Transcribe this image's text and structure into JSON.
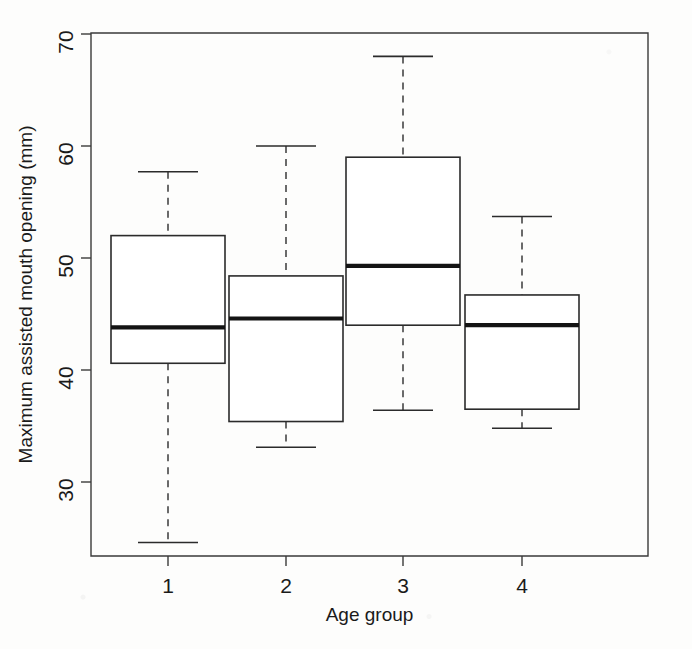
{
  "chart_data": {
    "type": "box",
    "title": "",
    "xlabel": "Age group",
    "ylabel": "Maximum assisted mouth opening (mm)",
    "categories": [
      "1",
      "2",
      "3",
      "4"
    ],
    "xtick_labels": [
      "1",
      "2",
      "3",
      "4"
    ],
    "ytick_labels": [
      "30",
      "40",
      "50",
      "60",
      "70"
    ],
    "yticks": [
      30,
      40,
      50,
      60,
      70
    ],
    "ylim": [
      23.5,
      70
    ],
    "xlim": [
      0.5,
      4.5
    ],
    "grid": false,
    "legend": false,
    "boxes": [
      {
        "category": "1",
        "whisker_low": 24.6,
        "q1": 40.6,
        "median": 43.8,
        "q3": 52.0,
        "whisker_high": 57.7
      },
      {
        "category": "2",
        "whisker_low": 33.1,
        "q1": 35.4,
        "median": 44.6,
        "q3": 48.4,
        "whisker_high": 60.0
      },
      {
        "category": "3",
        "whisker_low": 36.4,
        "q1": 44.0,
        "median": 49.3,
        "q3": 59.0,
        "whisker_high": 68.0
      },
      {
        "category": "4",
        "whisker_low": 34.8,
        "q1": 36.5,
        "median": 44.0,
        "q3": 46.7,
        "whisker_high": 53.7
      }
    ],
    "colors": {
      "box_fill": "#ffffff",
      "box_stroke": "#2b2b2b",
      "median": "#141414",
      "whisker": "#3a3a3a",
      "axis": "#3a3a3a",
      "background": "#fdfdfc"
    }
  }
}
